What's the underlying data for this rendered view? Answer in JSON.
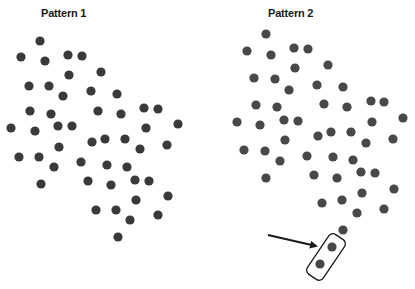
{
  "panels": [
    {
      "title": "Pattern 1",
      "dot_color": "#3a3a3a",
      "dots": [
        [
          40,
          41
        ],
        [
          21,
          57
        ],
        [
          45,
          61
        ],
        [
          68,
          55
        ],
        [
          82,
          56
        ],
        [
          101,
          72
        ],
        [
          69,
          75
        ],
        [
          29,
          86
        ],
        [
          49,
          86
        ],
        [
          63,
          96
        ],
        [
          91,
          91
        ],
        [
          117,
          94
        ],
        [
          98,
          111
        ],
        [
          121,
          114
        ],
        [
          144,
          108
        ],
        [
          158,
          109
        ],
        [
          30,
          111
        ],
        [
          51,
          114
        ],
        [
          146,
          128
        ],
        [
          178,
          124
        ],
        [
          11,
          128
        ],
        [
          35,
          131
        ],
        [
          58,
          126
        ],
        [
          72,
          126
        ],
        [
          92,
          142
        ],
        [
          105,
          139
        ],
        [
          125,
          139
        ],
        [
          140,
          149
        ],
        [
          167,
          145
        ],
        [
          59,
          147
        ],
        [
          19,
          157
        ],
        [
          39,
          157
        ],
        [
          54,
          167
        ],
        [
          81,
          162
        ],
        [
          107,
          165
        ],
        [
          127,
          167
        ],
        [
          41,
          184
        ],
        [
          88,
          181
        ],
        [
          111,
          185
        ],
        [
          135,
          180
        ],
        [
          149,
          181
        ],
        [
          136,
          200
        ],
        [
          168,
          196
        ],
        [
          96,
          210
        ],
        [
          116,
          210
        ],
        [
          130,
          220
        ],
        [
          158,
          215
        ],
        [
          118,
          237
        ]
      ]
    },
    {
      "title": "Pattern 2",
      "dot_color": "#484848",
      "dots": [
        [
          266,
          34
        ],
        [
          247,
          51
        ],
        [
          271,
          55
        ],
        [
          294,
          48
        ],
        [
          308,
          49
        ],
        [
          295,
          68
        ],
        [
          328,
          65
        ],
        [
          254,
          78
        ],
        [
          275,
          79
        ],
        [
          289,
          90
        ],
        [
          317,
          85
        ],
        [
          343,
          87
        ],
        [
          256,
          105
        ],
        [
          277,
          107
        ],
        [
          324,
          104
        ],
        [
          347,
          107
        ],
        [
          371,
          101
        ],
        [
          384,
          102
        ],
        [
          237,
          122
        ],
        [
          260,
          125
        ],
        [
          284,
          120
        ],
        [
          298,
          121
        ],
        [
          372,
          122
        ],
        [
          403,
          118
        ],
        [
          285,
          140
        ],
        [
          318,
          136
        ],
        [
          331,
          132
        ],
        [
          351,
          132
        ],
        [
          366,
          143
        ],
        [
          393,
          139
        ],
        [
          244,
          150
        ],
        [
          265,
          151
        ],
        [
          280,
          161
        ],
        [
          307,
          156
        ],
        [
          333,
          157
        ],
        [
          353,
          160
        ],
        [
          266,
          178
        ],
        [
          314,
          175
        ],
        [
          337,
          178
        ],
        [
          361,
          172
        ],
        [
          375,
          173
        ],
        [
          362,
          193
        ],
        [
          394,
          189
        ],
        [
          322,
          203
        ],
        [
          342,
          200
        ],
        [
          357,
          213
        ],
        [
          384,
          209
        ],
        [
          343,
          230
        ],
        [
          332,
          247
        ],
        [
          320,
          264
        ]
      ]
    }
  ],
  "annotation": {
    "arrow": {
      "x1": 268,
      "y1": 235,
      "x2": 316,
      "y2": 246
    },
    "highlight_box": {
      "cx": 326,
      "cy": 257,
      "length": 48,
      "width": 19,
      "angle": -56
    },
    "color": "#1a1a1a"
  }
}
